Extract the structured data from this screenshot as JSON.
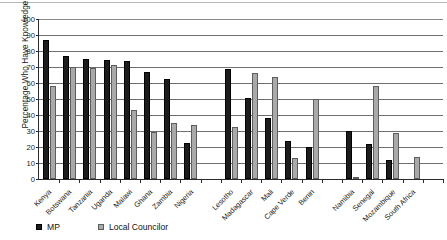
{
  "chart_data": {
    "type": "bar",
    "title": "",
    "subtitle": "",
    "xlabel": "",
    "ylabel": "Percentage Who Have Knowledge",
    "ylim": [
      0,
      100
    ],
    "ytick_step": 10,
    "yticks": [
      0,
      10,
      20,
      30,
      40,
      50,
      60,
      70,
      80,
      90,
      100
    ],
    "grid": "horizontal",
    "legend_position": "bottom-left",
    "categories": [
      "Kenya",
      "Botswana",
      "Tanzania",
      "Uganda",
      "Malawi",
      "Ghana",
      "Zambia",
      "Nigeria",
      "",
      "Lesotho",
      "Madagascar",
      "Mali",
      "Cape Verde",
      "Benin",
      "",
      "Namibia",
      "Senegal",
      "Mozambique",
      "South Africa",
      ""
    ],
    "series": [
      {
        "name": "MP",
        "color": "#1c1c1c",
        "values": [
          87,
          77,
          75,
          74.5,
          74,
          67,
          62.5,
          22.5,
          0,
          68.5,
          50.5,
          38,
          24,
          20,
          0,
          30,
          22,
          12,
          0,
          0
        ]
      },
      {
        "name": "Local Councilor",
        "color": "#a9a9a9",
        "values": [
          58,
          70,
          69.5,
          71,
          43,
          29.5,
          35,
          34,
          0,
          32.5,
          66.5,
          64,
          13,
          50,
          0,
          0.7,
          58,
          29,
          13.5,
          0
        ]
      }
    ]
  },
  "legend": {
    "items": [
      {
        "label": "MP",
        "swatch": "mp"
      },
      {
        "label": "Local Councilor",
        "swatch": "lc"
      }
    ]
  }
}
